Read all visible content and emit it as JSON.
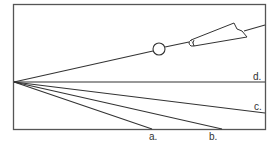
{
  "diagram": {
    "type": "light-ray-refraction",
    "labels": {
      "a": "a.",
      "b": "b.",
      "c": "c.",
      "d": "d."
    },
    "colors": {
      "line": "#333333",
      "background": "#ffffff",
      "frame": "#555555"
    },
    "elements": [
      {
        "name": "container-box",
        "description": "rectangular boundary"
      },
      {
        "name": "incident-ray",
        "description": "ray from flashlight through ball to left wall point"
      },
      {
        "name": "ball",
        "description": "small circle on the incident ray"
      },
      {
        "name": "flashlight",
        "description": "light source at upper right"
      },
      {
        "name": "ray-a",
        "label": "a."
      },
      {
        "name": "ray-b",
        "label": "b."
      },
      {
        "name": "ray-c",
        "label": "c."
      },
      {
        "name": "ray-d",
        "label": "d."
      }
    ]
  }
}
